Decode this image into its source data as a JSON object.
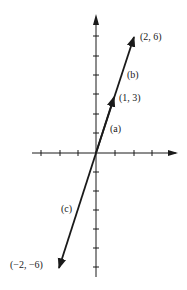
{
  "diagram": {
    "axes": {
      "x_ticks": [
        -3,
        -2,
        -1,
        1,
        2,
        3
      ],
      "y_ticks": [
        -6,
        -5,
        -4,
        -3,
        -2,
        -1,
        1,
        2,
        3,
        4,
        5,
        6
      ]
    },
    "vectors": [
      {
        "id": "a",
        "label": "(a)",
        "from": [
          0,
          0
        ],
        "to": [
          1,
          3
        ],
        "point_label": "(1, 3)"
      },
      {
        "id": "b",
        "label": "(b)",
        "from": [
          0,
          0
        ],
        "to": [
          2,
          6
        ],
        "point_label": "(2, 6)"
      },
      {
        "id": "c",
        "label": "(c)",
        "from": [
          0,
          0
        ],
        "to": [
          -2,
          -6
        ],
        "point_label": "(−2, −6)"
      }
    ],
    "labels": {
      "a": "(a)",
      "b": "(b)",
      "c": "(c)",
      "p13": "(1, 3)",
      "p26": "(2, 6)",
      "pm2m6": "(−2, −6)"
    },
    "colors": {
      "ink": "#1a1a1a",
      "background": "#ffffff"
    }
  }
}
